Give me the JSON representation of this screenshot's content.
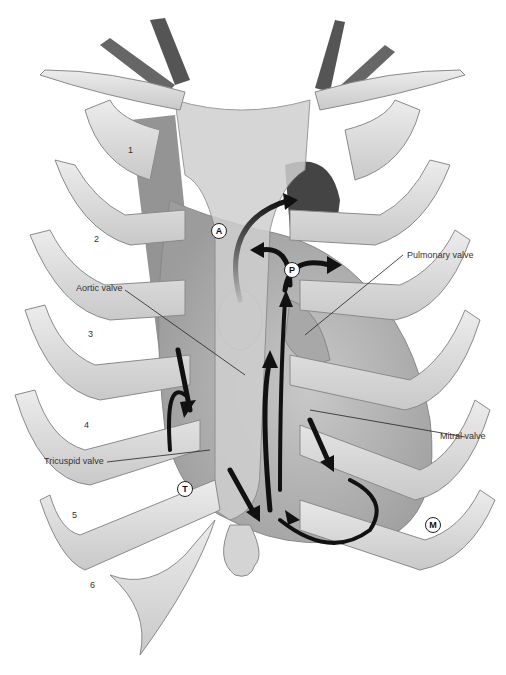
{
  "figure": {
    "labels": {
      "pulmonary_valve": "Pulmonary valve",
      "aortic_valve": "Aortic valve",
      "mitral_valve": "Mitral valve",
      "tricuspid_valve": "Tricuspid valve"
    },
    "markers": {
      "aortic": "A",
      "pulmonary": "P",
      "tricuspid": "T",
      "mitral": "M"
    },
    "rib_numbers": [
      "1",
      "2",
      "3",
      "4",
      "5",
      "6"
    ],
    "colors": {
      "background": "#ffffff",
      "rib": "#d9d9d9",
      "rib_edge": "#8a8a8a",
      "heart": "#bdbdbd",
      "vessels": "#555555",
      "arrows": "#111111",
      "leader_lines": "#222222"
    }
  }
}
